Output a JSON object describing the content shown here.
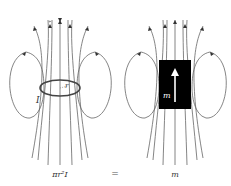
{
  "diagram": {
    "left": {
      "label_current": "I",
      "label_radius": "r",
      "caption": "πr²I"
    },
    "equals": "=",
    "right": {
      "label_moment": "m",
      "caption": "m"
    },
    "colors": {
      "field_line": "#555555",
      "loop": "#444444",
      "magnet": "#000000",
      "arrow_on_magnet": "#ffffff"
    }
  }
}
